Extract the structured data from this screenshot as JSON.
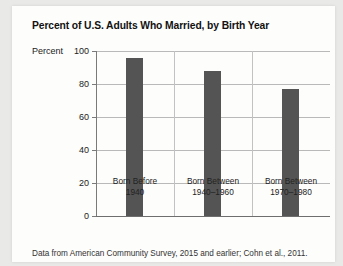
{
  "chart_data": {
    "type": "bar",
    "title": "Percent of U.S. Adults Who Married, by Birth Year",
    "xlabel": "",
    "ylabel": "Percent",
    "categories": [
      {
        "line1": "Born Before",
        "line2": "1940"
      },
      {
        "line1": "Born Between",
        "line2": "1940–1960"
      },
      {
        "line1": "Born Between",
        "line2": "1970–1980"
      }
    ],
    "values": [
      96,
      88,
      77
    ],
    "ylim": [
      0,
      100
    ],
    "yticks": [
      "0",
      "20",
      "40",
      "60",
      "80",
      "100"
    ],
    "grid": true,
    "legend": "none",
    "bar_color": "#545454",
    "source_note": "Data from American Community Survey, 2015 and earlier; Cohn et al., 2011."
  }
}
